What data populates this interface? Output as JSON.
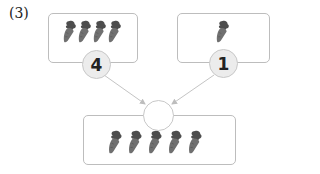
{
  "problem_label": "(3)",
  "left_box": {
    "carrot_count": 4,
    "number": "4"
  },
  "right_box": {
    "carrot_count": 1,
    "number": "1"
  },
  "result_box": {
    "carrot_count": 5,
    "answer": ""
  },
  "colors": {
    "carrot_body": "#6a6a6a",
    "carrot_leaf": "#4a4a4a",
    "circle_fill": "#ececec",
    "border": "#bdbdbd",
    "arrow": "#c4c4c4"
  }
}
